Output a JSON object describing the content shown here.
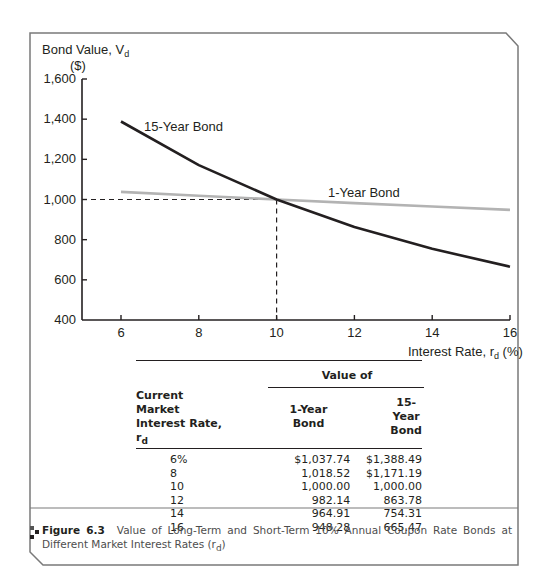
{
  "chart_data": {
    "type": "line",
    "title": "",
    "ylabel": "Bond Value, V_d ($)",
    "ylabel_line1": "Bond Value, V",
    "ylabel_sub": "d",
    "ylabel_line2": "($)",
    "xlabel": "Interest Rate, r_d (%)",
    "xlabel_main": "Interest Rate, r",
    "xlabel_sub": "d",
    "xlabel_suffix": " (%)",
    "xlim": [
      5,
      16
    ],
    "ylim": [
      400,
      1600
    ],
    "x_ticks": [
      "6",
      "8",
      "10",
      "12",
      "14",
      "16"
    ],
    "y_ticks": [
      "400",
      "600",
      "800",
      "1,000",
      "1,200",
      "1,400",
      "1,600"
    ],
    "grid": false,
    "x": [
      6,
      8,
      10,
      12,
      14,
      16
    ],
    "series": [
      {
        "name": "15-Year Bond",
        "color": "#231f20",
        "values": [
          1388.49,
          1171.19,
          1000.0,
          863.78,
          754.31,
          665.47
        ]
      },
      {
        "name": "1-Year Bond",
        "color": "#b3b3b3",
        "values": [
          1037.74,
          1018.52,
          1000.0,
          982.14,
          964.91,
          948.28
        ]
      }
    ],
    "annotations": [
      {
        "type": "dashed-reference",
        "x": 10,
        "y": 1000
      }
    ]
  },
  "table": {
    "group_header": "Value of",
    "col1_header_line1": "Current Market",
    "col1_header_line2": "Interest Rate, r",
    "col1_header_sub": "d",
    "col2_header_line1": "1-Year",
    "col2_header_line2": "Bond",
    "col3_header_line1": "15-Year",
    "col3_header_line2": "Bond",
    "rows": [
      {
        "rate": "6%",
        "one_year": "$1,037.74",
        "fifteen_year": "$1,388.49"
      },
      {
        "rate": "8",
        "one_year": "1,018.52",
        "fifteen_year": "$1,171.19"
      },
      {
        "rate": "10",
        "one_year": "1,000.00",
        "fifteen_year": "1,000.00"
      },
      {
        "rate": "12",
        "one_year": "982.14",
        "fifteen_year": "863.78"
      },
      {
        "rate": "14",
        "one_year": "964.91",
        "fifteen_year": "754.31"
      },
      {
        "rate": "16",
        "one_year": "948.28",
        "fifteen_year": "665.47"
      }
    ]
  },
  "caption": {
    "label": "Figure 6.3",
    "text": "Value of Long-Term and Short-Term 10% Annual Coupon Rate Bonds at Different Market Interest Rates (r",
    "sub": "d",
    "close": ")"
  }
}
